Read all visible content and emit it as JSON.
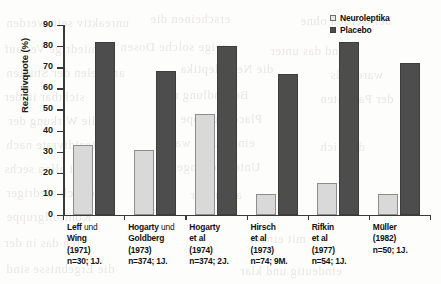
{
  "chart_data": {
    "type": "bar",
    "title": "",
    "xlabel": "",
    "ylabel": "Rezidivquote (%)",
    "ylim": [
      0,
      90
    ],
    "yticks": [
      0,
      10,
      20,
      30,
      40,
      50,
      60,
      70,
      80,
      90
    ],
    "grid": false,
    "legend_position": "top-right",
    "categories": [
      "Leff und Wing (1971) n=30; 1J.",
      "Hogarty und Goldberg (1973) n=374; 1J.",
      "Hogarty et al (1974) n=374; 2J.",
      "Hirsch et al (1973) n=74; 9M.",
      "Rifkin et al (1977) n=54; 1J.",
      "Müller (1982) n=50; 1J."
    ],
    "series": [
      {
        "name": "Neuroleptika",
        "color": "#d9d9d9",
        "values": [
          33,
          31,
          48,
          10,
          15,
          10
        ]
      },
      {
        "name": "Placebo",
        "color": "#4d4d4d",
        "values": [
          82,
          68,
          80,
          67,
          82,
          72
        ]
      }
    ]
  },
  "legend": {
    "items": [
      {
        "label": "Neuroleptika",
        "swatch": "neuro"
      },
      {
        "label": "Placebo",
        "swatch": "placebo"
      }
    ]
  },
  "x_labels": [
    {
      "l1_bold": "Leff",
      "l1_thin": " und",
      "l2": "Wing",
      "l3": "(1971)",
      "l4": "n=30; 1J."
    },
    {
      "l1_bold": "Hogarty",
      "l1_thin": " und",
      "l2": "Goldberg",
      "l3": "(1973)",
      "l4": "n=374; 1J."
    },
    {
      "l1_bold": "Hogarty",
      "l1_thin": "",
      "l2": "et al",
      "l3": "(1974)",
      "l4": "n=374; 2J."
    },
    {
      "l1_bold": "Hirsch",
      "l1_thin": "",
      "l2": "et al",
      "l3": "(1973)",
      "l4": "n=74; 9M."
    },
    {
      "l1_bold": "Rifkin",
      "l1_thin": "",
      "l2": "et al",
      "l3": "(1977)",
      "l4": "n=54; 1J."
    },
    {
      "l1_bold": "Müller",
      "l1_thin": "",
      "l2": "",
      "l3": "(1982)",
      "l4": "n=50; 1J."
    }
  ],
  "ghost_text": [
    {
      "x": 6,
      "y": 16,
      "t": "unreaktiv sein werden"
    },
    {
      "x": 150,
      "y": 12,
      "t": "erscheinen die"
    },
    {
      "x": 300,
      "y": 14,
      "t": "bei werden ohne"
    },
    {
      "x": 4,
      "y": 42,
      "t": "miedrige Verlauf"
    },
    {
      "x": 120,
      "y": 40,
      "t": "zeige solche Dosen"
    },
    {
      "x": 270,
      "y": 44,
      "t": "und das unter"
    },
    {
      "x": 6,
      "y": 66,
      "t": "an vielen der Studien"
    },
    {
      "x": 180,
      "y": 62,
      "t": "die Neuroleptika"
    },
    {
      "x": 330,
      "y": 68,
      "t": "waren als"
    },
    {
      "x": 4,
      "y": 90,
      "t": "sichtbar in der"
    },
    {
      "x": 160,
      "y": 88,
      "t": "Behandlung mit"
    },
    {
      "x": 320,
      "y": 92,
      "t": "der Patienten"
    },
    {
      "x": 8,
      "y": 114,
      "t": "die Wirkung der"
    },
    {
      "x": 180,
      "y": 112,
      "t": "Placebogruppe"
    },
    {
      "x": 6,
      "y": 138,
      "t": "Rezidivrate nach"
    },
    {
      "x": 170,
      "y": 136,
      "t": "einem Jahr war"
    },
    {
      "x": 320,
      "y": 140,
      "t": "deutlich"
    },
    {
      "x": 4,
      "y": 162,
      "t": "bei allen sechs"
    },
    {
      "x": 170,
      "y": 160,
      "t": "Untersuchungen"
    },
    {
      "x": 6,
      "y": 186,
      "t": "erheblich niedriger"
    },
    {
      "x": 190,
      "y": 188,
      "t": "als in der"
    },
    {
      "x": 6,
      "y": 210,
      "t": "Kontrollgruppe"
    },
    {
      "x": 4,
      "y": 236,
      "t": "ren das in der"
    },
    {
      "x": 250,
      "y": 232,
      "t": "mit einem"
    },
    {
      "x": 6,
      "y": 262,
      "t": "die Ergebnisse sind"
    },
    {
      "x": 240,
      "y": 264,
      "t": "eindeutig und klar"
    }
  ]
}
